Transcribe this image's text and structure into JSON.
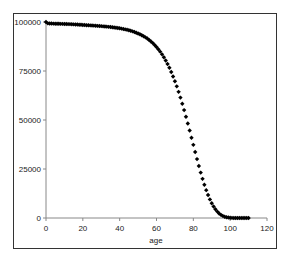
{
  "chart_data": {
    "type": "scatter",
    "title": "",
    "xlabel": "age",
    "ylabel": "",
    "xlim": [
      0,
      120
    ],
    "ylim": [
      0,
      100000
    ],
    "x_ticks": [
      "0",
      "20",
      "40",
      "60",
      "80",
      "100",
      "120"
    ],
    "y_ticks": [
      "0",
      "25000",
      "50000",
      "75000",
      "100000"
    ],
    "grid": false,
    "legend": null,
    "marker": "diamond",
    "marker_color": "#000000",
    "series": [
      {
        "name": "survivors",
        "x": [
          0,
          1,
          2,
          3,
          4,
          5,
          6,
          7,
          8,
          9,
          10,
          11,
          12,
          13,
          14,
          15,
          16,
          17,
          18,
          19,
          20,
          21,
          22,
          23,
          24,
          25,
          26,
          27,
          28,
          29,
          30,
          31,
          32,
          33,
          34,
          35,
          36,
          37,
          38,
          39,
          40,
          41,
          42,
          43,
          44,
          45,
          46,
          47,
          48,
          49,
          50,
          51,
          52,
          53,
          54,
          55,
          56,
          57,
          58,
          59,
          60,
          61,
          62,
          63,
          64,
          65,
          66,
          67,
          68,
          69,
          70,
          71,
          72,
          73,
          74,
          75,
          76,
          77,
          78,
          79,
          80,
          81,
          82,
          83,
          84,
          85,
          86,
          87,
          88,
          89,
          90,
          91,
          92,
          93,
          94,
          95,
          96,
          97,
          98,
          99,
          100,
          101,
          102,
          103,
          104,
          105,
          106,
          107,
          108,
          109,
          110
        ],
        "y": [
          100000,
          99300,
          99250,
          99200,
          99170,
          99140,
          99110,
          99080,
          99050,
          99020,
          99000,
          98970,
          98940,
          98900,
          98860,
          98810,
          98750,
          98690,
          98620,
          98560,
          98500,
          98440,
          98380,
          98320,
          98260,
          98200,
          98140,
          98080,
          98010,
          97940,
          97870,
          97790,
          97710,
          97620,
          97530,
          97430,
          97320,
          97200,
          97070,
          96930,
          96780,
          96610,
          96430,
          96230,
          96010,
          95770,
          95510,
          95220,
          94900,
          94550,
          94170,
          93740,
          93270,
          92750,
          92180,
          91550,
          90850,
          90080,
          89230,
          88290,
          87260,
          86120,
          84870,
          83500,
          82000,
          80360,
          78570,
          76620,
          74510,
          72230,
          69780,
          67160,
          64370,
          61420,
          58310,
          55060,
          51680,
          48190,
          44610,
          40970,
          37310,
          33660,
          30060,
          26550,
          23170,
          19970,
          16980,
          14220,
          11720,
          9490,
          7540,
          5860,
          4440,
          3270,
          2330,
          1600,
          1060,
          670,
          400,
          230,
          120,
          60,
          30,
          10,
          5,
          2,
          1,
          0,
          0,
          0,
          0
        ]
      }
    ]
  }
}
